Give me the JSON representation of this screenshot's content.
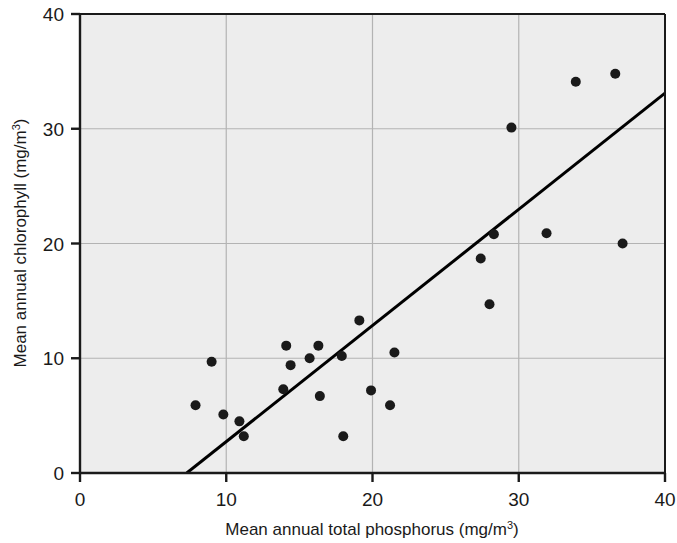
{
  "chart_data": {
    "type": "scatter",
    "title": "",
    "xlabel": "Mean annual total phosphorus (mg/m3)",
    "xlabel_main": "Mean annual total phosphorus (mg/m",
    "xlabel_sup": "3",
    "xlabel_tail": ")",
    "ylabel": "Mean annual chlorophyll (mg/m3)",
    "ylabel_main": "Mean annual chlorophyll (mg/m",
    "ylabel_sup": "3",
    "ylabel_tail": ")",
    "xlim": [
      0,
      40
    ],
    "ylim": [
      0,
      40
    ],
    "xticks": [
      0,
      10,
      20,
      30,
      40
    ],
    "yticks": [
      0,
      10,
      20,
      30,
      40
    ],
    "xtick_labels": [
      "0",
      "10",
      "20",
      "30",
      "40"
    ],
    "ytick_labels": [
      "0",
      "10",
      "20",
      "30",
      "40"
    ],
    "grid": true,
    "grid_color": "#b3b3b3",
    "plot_background": "#ededed",
    "axis_color": "#1a1a1a",
    "point_color": "#1a1a1a",
    "point_radius": 5,
    "legend": null,
    "points": [
      {
        "x": 7.9,
        "y": 5.9
      },
      {
        "x": 9.0,
        "y": 9.7
      },
      {
        "x": 9.8,
        "y": 5.1
      },
      {
        "x": 10.9,
        "y": 4.5
      },
      {
        "x": 11.2,
        "y": 3.2
      },
      {
        "x": 13.9,
        "y": 7.3
      },
      {
        "x": 14.1,
        "y": 11.1
      },
      {
        "x": 14.4,
        "y": 9.4
      },
      {
        "x": 15.7,
        "y": 10.0
      },
      {
        "x": 16.3,
        "y": 11.1
      },
      {
        "x": 16.4,
        "y": 6.7
      },
      {
        "x": 17.9,
        "y": 10.2
      },
      {
        "x": 18.0,
        "y": 3.2
      },
      {
        "x": 19.1,
        "y": 13.3
      },
      {
        "x": 19.9,
        "y": 7.2
      },
      {
        "x": 21.2,
        "y": 5.9
      },
      {
        "x": 21.5,
        "y": 10.5
      },
      {
        "x": 27.4,
        "y": 18.7
      },
      {
        "x": 28.0,
        "y": 14.7
      },
      {
        "x": 28.3,
        "y": 20.8
      },
      {
        "x": 29.5,
        "y": 30.1
      },
      {
        "x": 31.9,
        "y": 20.9
      },
      {
        "x": 33.9,
        "y": 34.1
      },
      {
        "x": 36.6,
        "y": 34.8
      },
      {
        "x": 37.1,
        "y": 20.0
      }
    ],
    "trendline": {
      "type": "line",
      "x0": 7.3,
      "y0": 0.0,
      "x1": 40.0,
      "y1": 33.1,
      "color": "#000000",
      "width": 3
    }
  }
}
